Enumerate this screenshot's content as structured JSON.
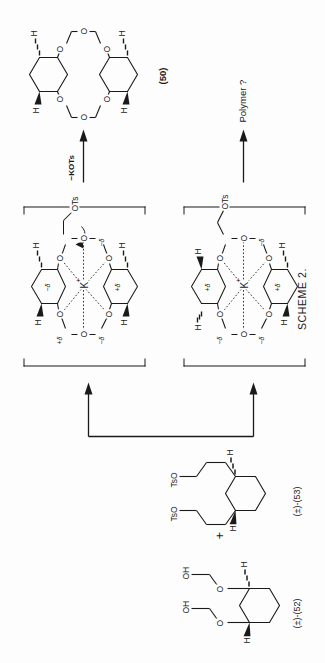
{
  "figure": {
    "caption": "SCHEME 2.",
    "domain": "chemical reaction scheme",
    "orientation_note": "printed rotated 90 degrees counter-clockwise on the page"
  },
  "labels": {
    "reactant_52": "(±)-(52)",
    "reactant_53": "(±)-(53)",
    "product_50": "(50)",
    "plus_sign": "+",
    "arrow_top_label": "−KOTs",
    "arrow_bottom_label": "Polymer ?"
  },
  "atoms": {
    "hydrogen": "H",
    "oxygen": "O",
    "hydroxyl": "OH",
    "tosylate_o": "OTs",
    "tosyloxy": "TsO",
    "potassium": "K",
    "plus_charge": "+",
    "minus_charge": "−",
    "delta": "δ"
  },
  "structures": [
    {
      "id": "52",
      "name": "(±)-(52)",
      "description": "trans-1,2-bis(2-hydroxyethoxy)cyclohexane",
      "features": [
        "cyclohexane ring",
        "two H stereo bonds (wedge and hash)",
        "two O ether links",
        "two OH termini"
      ],
      "terminal_groups": [
        "OH",
        "OH"
      ]
    },
    {
      "id": "53",
      "name": "(±)-(53)",
      "description": "trans-1,2-bis(3-tosyloxypropyl)cyclohexane",
      "features": [
        "cyclohexane ring",
        "two H stereo bonds (wedge and hash)",
        "two propyl chains",
        "two OTs leaving groups"
      ],
      "terminal_groups": [
        "TsO",
        "TsO"
      ]
    },
    {
      "id": "ts-top",
      "name": "potassium-templated transition state (productive)",
      "bracketed": true,
      "features": [
        "K+ cation at centre",
        "six dotted K···O coordination bonds",
        "two cyclohexane rings",
        "delta-plus and delta-minus partial charges",
        "pendant OTs chain with curved arrow showing displacement"
      ],
      "leads_to": "(50)"
    },
    {
      "id": "ts-bottom",
      "name": "potassium-templated transition state (non-productive)",
      "bracketed": true,
      "features": [
        "K+ cation at centre",
        "six dotted K···O coordination bonds",
        "two cyclohexane rings",
        "delta-plus and delta-minus partial charges",
        "open pendant chain ending in OTs"
      ],
      "leads_to": "Polymer ?"
    },
    {
      "id": "50",
      "name": "(50)",
      "description": "chiral dicyclohexano-crown ether macrocycle",
      "features": [
        "macrocyclic polyether ring",
        "two fused cyclohexane rings",
        "six ring oxygens",
        "four H stereo bonds (two wedges, two hashes)"
      ]
    }
  ],
  "arrows": [
    {
      "id": "arrow-to-ts-top",
      "label": "",
      "direction": "right",
      "style": "plain"
    },
    {
      "id": "arrow-to-ts-bottom",
      "label": "",
      "direction": "right",
      "style": "plain"
    },
    {
      "id": "arrow-to-50",
      "label": "−KOTs",
      "direction": "right",
      "style": "plain"
    },
    {
      "id": "arrow-to-polymer",
      "label": "Polymer ?",
      "direction": "right",
      "style": "plain"
    }
  ],
  "colors": {
    "ink": "#1a1a1a",
    "paper": "#fdfdfd"
  }
}
